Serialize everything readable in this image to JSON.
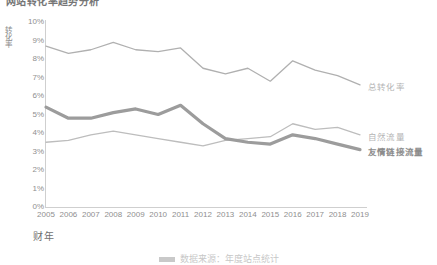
{
  "title": "网站转化率趋势分析",
  "caption": "数据来源：年度站点统计",
  "axes": {
    "ylabel": "转化率",
    "xlabel": "财年",
    "yticks": [
      "10%",
      "9%",
      "8%",
      "7%",
      "6%",
      "5%",
      "4%",
      "3%",
      "2%",
      "1%",
      "0%"
    ]
  },
  "chart_data": {
    "type": "line",
    "title": "网站转化率趋势分析",
    "xlabel": "财年",
    "ylabel": "转化率",
    "ylim": [
      0,
      10
    ],
    "ytick_step": 1,
    "grid": false,
    "legend": "right-end-labels",
    "categories": [
      "2005",
      "2006",
      "2007",
      "2008",
      "2009",
      "2010",
      "2011",
      "2012",
      "2013",
      "2014",
      "2015",
      "2016",
      "2017",
      "2018",
      "2019"
    ],
    "series": [
      {
        "name": "总转化率",
        "color": "#b0b0b0",
        "width": 1.3,
        "values": [
          8.7,
          8.3,
          8.5,
          8.9,
          8.5,
          8.4,
          8.6,
          7.5,
          7.2,
          7.5,
          6.8,
          7.9,
          7.4,
          7.1,
          6.6
        ]
      },
      {
        "name": "自然流量",
        "color": "#bdbdbd",
        "width": 1.3,
        "values": [
          3.5,
          3.6,
          3.9,
          4.1,
          3.9,
          3.7,
          3.5,
          3.3,
          3.6,
          3.7,
          3.8,
          4.5,
          4.2,
          4.3,
          3.9
        ]
      },
      {
        "name": "友情链接流量",
        "color": "#9c9c9c",
        "width": 3.2,
        "values": [
          5.4,
          4.8,
          4.8,
          5.1,
          5.3,
          5.0,
          5.5,
          4.5,
          3.7,
          3.5,
          3.4,
          3.9,
          3.7,
          3.4,
          3.1
        ]
      }
    ]
  }
}
